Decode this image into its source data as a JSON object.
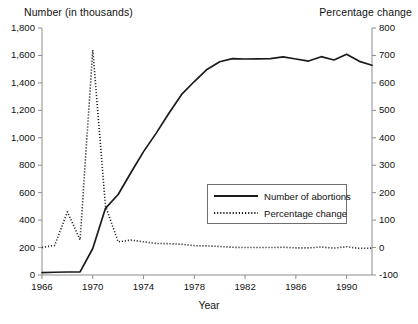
{
  "chart_data": {
    "type": "line",
    "title": "",
    "xlabel": "Year",
    "ylabel": "Number (in thousands)",
    "y2label": "Percentage change",
    "xlim": [
      1966,
      1992
    ],
    "ylim": [
      0,
      1800
    ],
    "y2lim": [
      -100,
      800
    ],
    "grid": false,
    "legend_position": "center-right-inside",
    "x_ticks": [
      "1966",
      "1970",
      "1974",
      "1978",
      "1982",
      "1986",
      "1990"
    ],
    "x_tick_values": [
      1966,
      1970,
      1974,
      1978,
      1982,
      1986,
      1990
    ],
    "y_ticks_left": [
      "0",
      "200",
      "400",
      "600",
      "800",
      "1,000",
      "1,200",
      "1,400",
      "1,600",
      "1,800"
    ],
    "y_tick_values_left": [
      0,
      200,
      400,
      600,
      800,
      1000,
      1200,
      1400,
      1600,
      1800
    ],
    "y_ticks_right": [
      "-100",
      "0",
      "100",
      "200",
      "300",
      "400",
      "500",
      "600",
      "700",
      "800"
    ],
    "y_tick_values_right": [
      -100,
      0,
      100,
      200,
      300,
      400,
      500,
      600,
      700,
      800
    ],
    "x": [
      1966,
      1967,
      1968,
      1969,
      1970,
      1971,
      1972,
      1973,
      1974,
      1975,
      1976,
      1977,
      1978,
      1979,
      1980,
      1981,
      1982,
      1983,
      1984,
      1985,
      1986,
      1987,
      1988,
      1989,
      1990,
      1991,
      1992
    ],
    "series": [
      {
        "name": "Number of abortions",
        "axis": "left",
        "style": "solid",
        "unit": "thousands",
        "values": [
          18,
          20,
          22,
          23,
          193,
          486,
          587,
          745,
          899,
          1034,
          1179,
          1316,
          1410,
          1498,
          1554,
          1577,
          1574,
          1575,
          1577,
          1589,
          1574,
          1559,
          1591,
          1567,
          1609,
          1557,
          1529
        ]
      },
      {
        "name": "Percentage change",
        "axis": "right",
        "style": "dotted",
        "unit": "percent",
        "values": [
          0,
          8,
          130,
          28,
          720,
          152,
          21,
          27,
          21,
          15,
          14,
          12,
          7,
          6,
          4,
          1,
          0,
          0,
          0,
          1,
          -1,
          -1,
          2,
          -2,
          3,
          -3,
          -2
        ]
      }
    ],
    "legend_entries": [
      {
        "label": "Number of abortions",
        "style": "solid"
      },
      {
        "label": "Percentage change",
        "style": "dotted"
      }
    ],
    "annotations": []
  },
  "axes": {
    "left_title": "Number (in thousands)",
    "right_title": "Percentage change",
    "bottom_title": "Year"
  },
  "colors": {
    "series_line": "#1b1b1b",
    "axis": "#8d8d8d",
    "text": "#111111",
    "background": "#ffffff"
  }
}
